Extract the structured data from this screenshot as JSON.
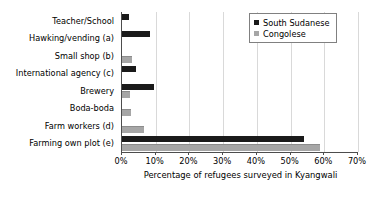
{
  "chart_data": {
    "type": "bar",
    "orientation": "horizontal",
    "title": "",
    "xlabel": "Percentage of refugees surveyed in Kyangwali",
    "ylabel": "",
    "xlim": [
      0,
      70
    ],
    "xtick_labels": [
      "0%",
      "10%",
      "20%",
      "30%",
      "40%",
      "50%",
      "60%",
      "70%"
    ],
    "xtick_values": [
      0,
      10,
      20,
      30,
      40,
      50,
      60,
      70
    ],
    "grid": true,
    "legend_position": "top-right",
    "categories": [
      "Teacher/School",
      "Hawking/vending (a)",
      "Small shop (b)",
      "International agency (c)",
      "Brewery",
      "Boda-boda",
      "Farm workers (d)",
      "Farming own plot (e)"
    ],
    "series": [
      {
        "name": "South Sudanese",
        "color": "#1a1a1a",
        "values": [
          2.2,
          8.2,
          0,
          4.2,
          9.6,
          0,
          0,
          54
        ]
      },
      {
        "name": "Congolese",
        "color": "#a6a6a6",
        "values": [
          0,
          0,
          3,
          0,
          2.5,
          2.6,
          6.6,
          58.8
        ]
      }
    ]
  },
  "legend": {
    "entries": [
      {
        "label": "South Sudanese",
        "swatch": "dark-square-icon"
      },
      {
        "label": "Congolese",
        "swatch": "gray-square-icon"
      }
    ]
  }
}
